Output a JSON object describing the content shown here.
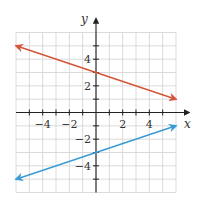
{
  "chart_data": {
    "type": "line",
    "title": "",
    "xlabel": "x",
    "ylabel": "y",
    "xlim": [
      -6,
      6
    ],
    "ylim": [
      -6,
      6
    ],
    "grid": true,
    "x_ticks": [
      -5,
      -4,
      -3,
      -2,
      -1,
      1,
      2,
      3,
      4,
      5
    ],
    "y_ticks": [
      -5,
      -4,
      -3,
      -2,
      -1,
      1,
      2,
      3,
      4,
      5
    ],
    "x_tick_labels": [
      {
        "value": -4,
        "label": "−4"
      },
      {
        "value": -2,
        "label": "−2"
      },
      {
        "value": 2,
        "label": "2"
      },
      {
        "value": 4,
        "label": "4"
      }
    ],
    "y_tick_labels": [
      {
        "value": 4,
        "label": "4"
      },
      {
        "value": 2,
        "label": "2"
      },
      {
        "value": -2,
        "label": "−2"
      },
      {
        "value": -4,
        "label": "−4"
      }
    ],
    "series": [
      {
        "name": "red line",
        "equation": "y = -x/3 + 3",
        "color": "#d6553a",
        "x": [
          -6,
          6
        ],
        "y": [
          5,
          1
        ],
        "arrows": "both"
      },
      {
        "name": "blue line",
        "equation": "y = x/3 - 3",
        "color": "#3a9cd4",
        "x": [
          -6,
          6
        ],
        "y": [
          -5,
          -1
        ],
        "arrows": "both"
      }
    ],
    "legend": null
  }
}
